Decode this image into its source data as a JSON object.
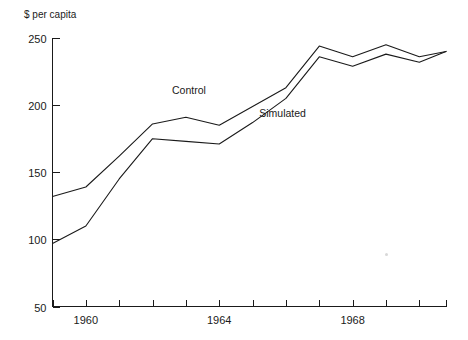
{
  "chart_data": {
    "type": "line",
    "title": "",
    "subtitle": "",
    "xlabel": "",
    "ylabel": "$ per capita",
    "axis_title_text": "$ per capita",
    "grid": false,
    "legend_position": "inline-annotation",
    "xlim": [
      1959,
      1970.8
    ],
    "ylim": [
      50,
      250
    ],
    "yticks": [
      50,
      100,
      150,
      200,
      250
    ],
    "ytick_labels": [
      "50",
      "100",
      "150",
      "200",
      "250"
    ],
    "xticks": [
      1959,
      1960,
      1961,
      1962,
      1963,
      1964,
      1965,
      1966,
      1967,
      1968,
      1969,
      1970,
      1970.8
    ],
    "xtick_labels_shown": [
      "1960",
      "1964",
      "1968"
    ],
    "xtick_label_values": [
      1960,
      1964,
      1968
    ],
    "x": [
      1959,
      1960,
      1961,
      1962,
      1963,
      1964,
      1965,
      1966,
      1967,
      1968,
      1969,
      1970,
      1970.8
    ],
    "series": [
      {
        "name": "Control",
        "label": "Control",
        "values": [
          132,
          139,
          162,
          186,
          191,
          185,
          199,
          213,
          244,
          236,
          245,
          236,
          240
        ],
        "color": "#1a1a1a",
        "annotation": {
          "text": "Control",
          "x": 1963.6,
          "y": 208
        }
      },
      {
        "name": "Simulated",
        "label": "Simulated",
        "values": [
          97,
          110,
          145,
          175,
          173,
          171,
          187,
          205,
          236,
          229,
          238,
          232,
          240
        ],
        "color": "#1a1a1a",
        "annotation": {
          "text": "Simulated",
          "x": 1965.2,
          "y": 191
        }
      }
    ],
    "annotations": [
      {
        "text": "Control",
        "series": "Control"
      },
      {
        "text": "Simulated",
        "series": "Simulated"
      }
    ],
    "colors": {
      "line": "#1a1a1a",
      "axis": "#1a1a1a",
      "background": "#ffffff"
    }
  }
}
